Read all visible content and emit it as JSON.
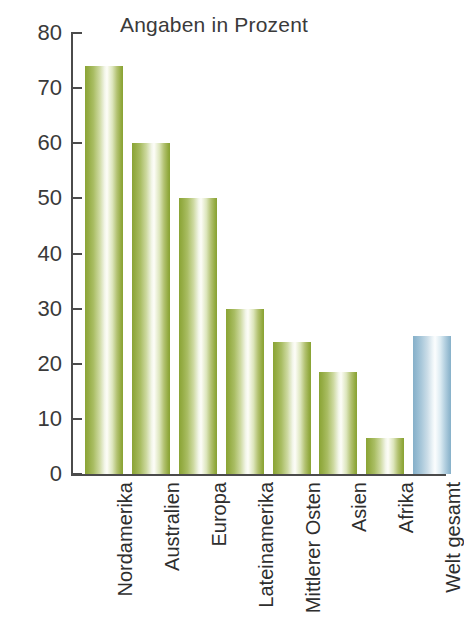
{
  "chart_data": {
    "type": "bar",
    "title": "Angaben in Prozent",
    "xlabel": "",
    "ylabel": "",
    "ylim": [
      0,
      80
    ],
    "yticks": [
      0,
      10,
      20,
      30,
      40,
      50,
      60,
      70,
      80
    ],
    "ytick_labels": [
      "0",
      "10",
      "20",
      "30",
      "40",
      "50",
      "60",
      "70",
      "80"
    ],
    "grid": false,
    "legend": false,
    "categories": [
      "Nordamerika",
      "Australien",
      "Europa",
      "Lateinamerika",
      "Mittlerer Osten",
      "Asien",
      "Afrika",
      "Welt gesamt"
    ],
    "values": [
      74,
      60,
      50,
      30,
      24,
      18.5,
      6.5,
      25
    ],
    "bar_colors": [
      "green",
      "green",
      "green",
      "green",
      "green",
      "green",
      "green",
      "blue"
    ],
    "colors": {
      "green": "#8aa435",
      "blue": "#86b0c9",
      "axis": "#4b4b4b",
      "text": "#2e2e2e",
      "background": "#ffffff"
    }
  }
}
